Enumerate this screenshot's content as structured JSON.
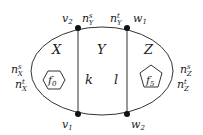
{
  "diagram": {
    "type": "planar-graph-faces",
    "regions": {
      "X": "X",
      "Y": "Y",
      "Z": "Z"
    },
    "vertices": {
      "v1": {
        "base": "v",
        "sub": "1"
      },
      "v2": {
        "base": "v",
        "sub": "2"
      },
      "w1": {
        "base": "w",
        "sub": "1"
      },
      "w2": {
        "base": "w",
        "sub": "2"
      }
    },
    "edges": {
      "k": "k",
      "l": "l"
    },
    "faces": {
      "f0": {
        "base": "f",
        "sub": "0",
        "shape": "hexagon"
      },
      "f5": {
        "base": "f",
        "sub": "5",
        "shape": "pentagon"
      }
    },
    "annotations": {
      "nY_s": {
        "base": "n",
        "sup": "s",
        "sub": "Y"
      },
      "nY_t": {
        "base": "n",
        "sup": "t",
        "sub": "Y"
      },
      "nX_s": {
        "base": "n",
        "sup": "s",
        "sub": "X"
      },
      "nX_t": {
        "base": "n",
        "sup": "t",
        "sub": "X"
      },
      "nZ_s": {
        "base": "n",
        "sup": "s",
        "sub": "Z"
      },
      "nZ_t": {
        "base": "n",
        "sup": "t",
        "sub": "Z"
      }
    },
    "colors": {
      "stroke": "#333333",
      "vertex": "#111111",
      "text": "#222222"
    }
  }
}
